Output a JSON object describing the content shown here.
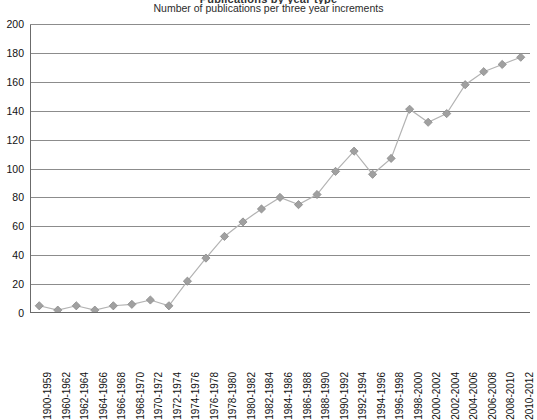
{
  "super_title": "Publications by year type",
  "chart_title": "Number of publications per three year increments",
  "colors": {
    "line": "#b3b3b3",
    "marker": "#a0a0a0",
    "marker_edge": "#8c8c8c",
    "grid": "#8c8c8c",
    "axis": "#6b6b6b",
    "text": "#111111"
  },
  "chart_data": {
    "type": "line",
    "title": "Number of publications per three year increments",
    "xlabel": "",
    "ylabel": "",
    "ylim": [
      0,
      200
    ],
    "ytick_step": 20,
    "yticks": [
      0,
      20,
      40,
      60,
      80,
      100,
      120,
      140,
      160,
      180,
      200
    ],
    "grid": true,
    "legend": null,
    "categories": [
      "1900-1959",
      "1960-1962",
      "1962-1964",
      "1964-1966",
      "1966-1968",
      "1968-1970",
      "1970-1972",
      "1972-1974",
      "1974-1976",
      "1976-1978",
      "1978-1980",
      "1980-1982",
      "1982-1984",
      "1984-1986",
      "1986-1988",
      "1988-1990",
      "1990-1992",
      "1992-1994",
      "1994-1996",
      "1996-1998",
      "1998-2000",
      "2000-2002",
      "2002-2004",
      "2004-2006",
      "2006-2008",
      "2008-2010",
      "2010-2012"
    ],
    "values": [
      5,
      2,
      5,
      2,
      5,
      6,
      9,
      5,
      22,
      38,
      53,
      63,
      72,
      80,
      75,
      82,
      98,
      112,
      96,
      107,
      141,
      132,
      138,
      158,
      167,
      172,
      177
    ]
  }
}
